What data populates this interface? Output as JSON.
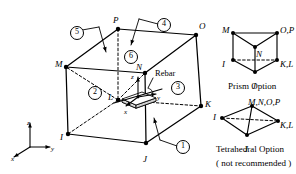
{
  "diagram": {
    "background": "#ffffff",
    "line_color": "#000000"
  },
  "main_element": {
    "name": "8-node brick element",
    "vertices": [
      {
        "id": "P",
        "label": "P",
        "x": 118,
        "y": 29,
        "lx": 113,
        "ly": 16
      },
      {
        "id": "O",
        "label": "O",
        "x": 196,
        "y": 35,
        "lx": 199,
        "ly": 22
      },
      {
        "id": "M",
        "label": "M",
        "x": 66,
        "y": 67,
        "lx": 55,
        "ly": 60
      },
      {
        "id": "N",
        "label": "N",
        "x": 145,
        "y": 73,
        "lx": 136,
        "ly": 63
      },
      {
        "id": "L",
        "label": "L",
        "x": 118,
        "y": 100,
        "lx": 108,
        "ly": 93
      },
      {
        "id": "K",
        "label": "K",
        "x": 201,
        "y": 106,
        "lx": 205,
        "ly": 100
      },
      {
        "id": "I",
        "label": "I",
        "x": 68,
        "y": 134,
        "lx": 60,
        "ly": 133
      },
      {
        "id": "J",
        "label": "J",
        "x": 146,
        "y": 143,
        "lx": 143,
        "ly": 155
      }
    ],
    "solid_edges": [
      [
        "P",
        "O"
      ],
      [
        "P",
        "M"
      ],
      [
        "O",
        "N"
      ],
      [
        "M",
        "N"
      ],
      [
        "M",
        "I"
      ],
      [
        "N",
        "J"
      ],
      [
        "O",
        "K"
      ],
      [
        "I",
        "J"
      ],
      [
        "J",
        "K"
      ]
    ],
    "hidden_edges": [
      [
        "P",
        "L"
      ],
      [
        "L",
        "M"
      ],
      [
        "L",
        "N"
      ],
      [
        "L",
        "I"
      ],
      [
        "L",
        "K"
      ]
    ]
  },
  "face_callouts": [
    {
      "id": "1",
      "label": "①",
      "x": 176,
      "y": 140,
      "leader_to_x": 154,
      "leader_to_y": 118,
      "leader_elbow_x": 160,
      "leader_elbow_y": 140
    },
    {
      "id": "2",
      "label": "②",
      "x": 88,
      "y": 86,
      "leader": false
    },
    {
      "id": "3",
      "label": "③",
      "x": 171,
      "y": 81,
      "leader": false
    },
    {
      "id": "4",
      "label": "④",
      "x": 157,
      "y": 18,
      "leader_to_x": 131,
      "leader_to_y": 45,
      "leader_elbow_x": 139,
      "leader_elbow_y": 19
    },
    {
      "id": "5",
      "label": "⑤",
      "x": 70,
      "y": 26,
      "leader_to_x": 106,
      "leader_to_y": 52,
      "leader_elbow_x": 99,
      "leader_elbow_y": 27
    },
    {
      "id": "6",
      "label": "⑥",
      "x": 124,
      "y": 50,
      "leader": false
    }
  ],
  "rebar": {
    "label": "Rebar",
    "label_x": 155,
    "label_y": 69,
    "leader_to_x": 148,
    "leader_to_y": 88
  },
  "local_axes": {
    "origin_x": 138,
    "origin_y": 97,
    "labels": [
      {
        "text": "z",
        "x": 131,
        "y": 74
      },
      {
        "text": "y",
        "x": 157,
        "y": 95
      },
      {
        "text": "x",
        "x": 124,
        "y": 109
      }
    ]
  },
  "global_axes": {
    "origin_x": 30,
    "origin_y": 147,
    "labels": [
      {
        "text": "z",
        "x": 27,
        "y": 120
      },
      {
        "text": "y",
        "x": 51,
        "y": 146
      },
      {
        "text": "x",
        "x": 11,
        "y": 156
      }
    ]
  },
  "prism_option": {
    "caption": "Prism Option",
    "caption_x": 228,
    "caption_y": 82,
    "nodes": [
      {
        "label": "M",
        "x": 233,
        "y": 33,
        "lx": 222,
        "ly": 26
      },
      {
        "label": "O,P",
        "x": 277,
        "y": 33,
        "lx": 280,
        "ly": 26
      },
      {
        "label": "N",
        "x": 255,
        "y": 47,
        "lx": 256,
        "ly": 50
      },
      {
        "label": "I",
        "x": 233,
        "y": 60,
        "lx": 222,
        "ly": 60
      },
      {
        "label": "K,L",
        "x": 277,
        "y": 60,
        "lx": 280,
        "ly": 60
      },
      {
        "label": "J",
        "x": 255,
        "y": 72,
        "lx": 252,
        "ly": 82
      }
    ]
  },
  "tetrahedral_option": {
    "caption": "Tetrahedral Option",
    "caption_x": 216,
    "caption_y": 145,
    "note": "( not recommended )",
    "note_x": 216,
    "note_y": 159,
    "nodes": [
      {
        "label": "M,N,O,P",
        "x": 252,
        "y": 106,
        "lx": 248,
        "ly": 98
      },
      {
        "label": "I",
        "x": 222,
        "y": 118,
        "lx": 213,
        "ly": 113
      },
      {
        "label": "K,L",
        "x": 278,
        "y": 121,
        "lx": 280,
        "ly": 121
      },
      {
        "label": "J",
        "x": 247,
        "y": 135,
        "lx": 244,
        "ly": 145
      }
    ]
  }
}
